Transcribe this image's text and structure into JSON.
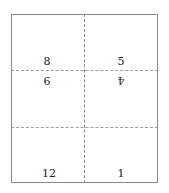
{
  "diagram": {
    "type": "imposition-layout",
    "fold_lines": {
      "vertical": 1,
      "horizontal": 2,
      "style": "dashed"
    },
    "pages": [
      {
        "label": "8",
        "position": "upper-left-above-fold",
        "rotated": false
      },
      {
        "label": "5",
        "position": "upper-right-above-fold",
        "rotated": false
      },
      {
        "label": "9",
        "position": "upper-left-below-fold",
        "rotated": true
      },
      {
        "label": "4",
        "position": "upper-right-below-fold",
        "rotated": true
      },
      {
        "label": "12",
        "position": "bottom-left",
        "rotated": false
      },
      {
        "label": "1",
        "position": "bottom-right",
        "rotated": false
      }
    ],
    "colors": {
      "line": "#8a8a8a",
      "text": "#222222",
      "background": "#ffffff"
    }
  }
}
